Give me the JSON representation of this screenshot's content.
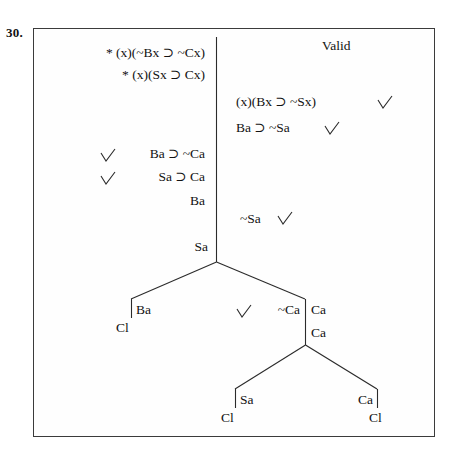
{
  "problem": {
    "number": "30.",
    "verdict": "Valid"
  },
  "colors": {
    "ink": "#121212",
    "border": "#3b3b3b",
    "line": "#2b2b2b",
    "background": "#ffffff"
  },
  "premises": [
    {
      "id": "p1",
      "text": "* (x)(~Bx ⊃ ~Cx)",
      "starred": true
    },
    {
      "id": "p2",
      "text": "* (x)(Sx ⊃ Cx)",
      "starred": true
    }
  ],
  "right_column": [
    {
      "id": "r1",
      "text": "(x)(Bx ⊃ ~Sx)",
      "checked": true
    },
    {
      "id": "r2",
      "text": "Ba ⊃ ~Sa",
      "checked": true
    }
  ],
  "left_column": [
    {
      "id": "l1",
      "text": "Ba ⊃ ~Ca",
      "checked": true
    },
    {
      "id": "l2",
      "text": "Sa ⊃ Ca",
      "checked": true
    },
    {
      "id": "l3",
      "text": "Ba",
      "checked": false
    }
  ],
  "trunk_nodes": [
    {
      "id": "t1",
      "text": "~Sa",
      "checked": true
    },
    {
      "id": "t2",
      "text": "Sa",
      "checked": false
    }
  ],
  "branch_level_1": {
    "left": {
      "text": "Ba",
      "closed_mark": "Cl"
    },
    "right": {
      "text": "~Ca",
      "checked": true,
      "stem": [
        "Ca",
        "Ca"
      ]
    }
  },
  "branch_level_2": {
    "left": {
      "text": "Sa",
      "closed_mark": "Cl"
    },
    "right": {
      "text": "Ca",
      "closed_mark": "Cl"
    }
  },
  "labels": {
    "closed_branch": "Cl",
    "checkmark": "✓"
  }
}
